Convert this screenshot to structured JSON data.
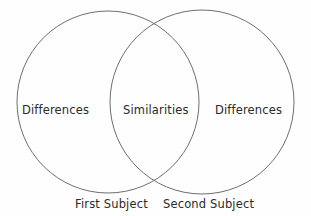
{
  "figure": {
    "type": "venn-diagram",
    "background_color": "#fefefe",
    "stroke_color": "#6e6e6e",
    "text_color": "#2b2b2b",
    "width": 311,
    "height": 216
  },
  "circles": {
    "left": {
      "name": "First Subject",
      "cx": 108,
      "cy": 102,
      "r": 91
    },
    "right": {
      "name": "Second Subject",
      "cx": 202,
      "cy": 102,
      "r": 92
    }
  },
  "regions": {
    "left_only": "Differences",
    "overlap": "Similarities",
    "right_only": "Differences"
  },
  "subjects": {
    "first": "First Subject",
    "second": "Second Subject"
  }
}
